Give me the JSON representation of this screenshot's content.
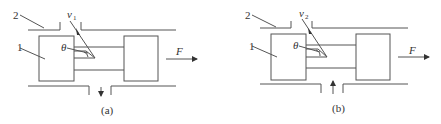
{
  "figures": [
    {
      "id": "a",
      "caption": "(a)",
      "labels": {
        "part_1": "1",
        "part_2": "2",
        "angle": "θ",
        "velocity": "v",
        "velocity_sub": "1",
        "force": "F"
      },
      "port_flow_direction": "down"
    },
    {
      "id": "b",
      "caption": "(b)",
      "labels": {
        "part_1": "1",
        "part_2": "2",
        "angle": "θ",
        "velocity": "v",
        "velocity_sub": "2",
        "force": "F"
      },
      "port_flow_direction": "up"
    }
  ],
  "colors": {
    "line": "#555555",
    "text": "#333333",
    "background": "#ffffff"
  }
}
